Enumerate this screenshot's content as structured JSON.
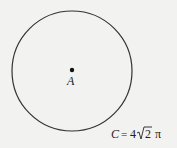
{
  "diagram": {
    "circle": {
      "cx": 72,
      "cy": 71,
      "r": 60,
      "stroke": "#333333"
    },
    "center_point": {
      "label": "A",
      "x": 72,
      "y": 70
    },
    "circumference_label": {
      "variable": "C",
      "equals": "=",
      "coefficient": "4",
      "radicand": "2",
      "pi": "π"
    }
  }
}
